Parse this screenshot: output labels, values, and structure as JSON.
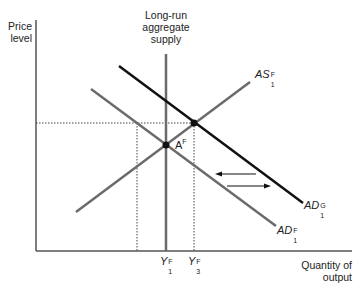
{
  "axes": {
    "y_label_line1": "Price",
    "y_label_line2": "level",
    "x_label_line1": "Quantity of",
    "x_label_line2": "output"
  },
  "lras": {
    "label_line1": "Long-run",
    "label_line2": "aggregate",
    "label_line3": "supply"
  },
  "curves": {
    "as": {
      "base": "AS",
      "sup": "F",
      "sub": "1"
    },
    "ad_g": {
      "base": "AD",
      "sup": "G",
      "sub": "1"
    },
    "ad_f": {
      "base": "AD",
      "sup": "F",
      "sub": "1"
    }
  },
  "points": {
    "a": {
      "base": "A",
      "sup": "F"
    }
  },
  "x_ticks": {
    "y1": {
      "base": "Y",
      "sup": "F",
      "sub": "1"
    },
    "y3": {
      "base": "Y",
      "sup": "F",
      "sub": "3"
    }
  },
  "colors": {
    "axis": "#555555",
    "gray_curve": "#6b6b6b",
    "black_curve": "#111111",
    "dotted": "#444444"
  }
}
